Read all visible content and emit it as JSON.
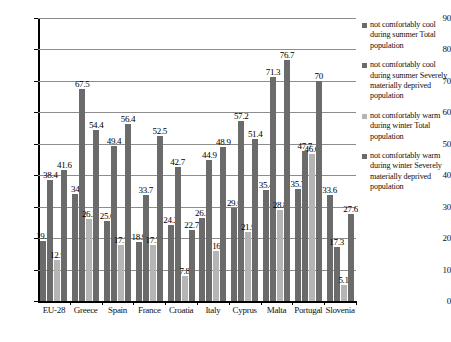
{
  "chart_data": {
    "type": "bar",
    "title": "",
    "subtitle": "",
    "xlabel": "",
    "ylabel": "",
    "ylim": [
      0,
      90
    ],
    "ytick_step": 10,
    "yticks": [
      0,
      10,
      20,
      30,
      40,
      50,
      60,
      70,
      80,
      90
    ],
    "grid": true,
    "grid_axis": "y",
    "legend_position": "right",
    "categories": [
      "EU-28",
      "Greece",
      "Spain",
      "France",
      "Croatia",
      "Italy",
      "Cyprus",
      "Malta",
      "Portugal",
      "Slovenia"
    ],
    "series": [
      {
        "name": "not comfortably cool during summer  Total population",
        "color": "#6b6b6b",
        "values": [
          19.2,
          34,
          25.6,
          18.9,
          24.2,
          26.3,
          29.6,
          35.4,
          35.7,
          33.6
        ]
      },
      {
        "name": "not comfortably cool during summer Severely materially deprived population",
        "color": "#6b6b6b",
        "values": [
          38.4,
          67.5,
          49.4,
          33.7,
          42.7,
          44.9,
          57.2,
          71.3,
          47.7,
          17.3
        ]
      },
      {
        "name": "not comfortably warm during winter Total population",
        "color": "#b5b5b5",
        "values": [
          12.9,
          26.2,
          17.7,
          17.7,
          7.8,
          16,
          21.9,
          28.8,
          46.6,
          5.1
        ]
      },
      {
        "name": "not comfortably warm during winter Severely materially deprived population",
        "color": "#6b6b6b",
        "values": [
          41.6,
          54.4,
          56.4,
          52.5,
          22.7,
          48.9,
          51.4,
          76.7,
          70,
          27.6
        ]
      }
    ]
  },
  "legend": {
    "items": [
      {
        "label": "not comfortably cool during summer  Total population",
        "swatch": "sw1"
      },
      {
        "label": "not comfortably cool during summer Severely materially deprived population",
        "swatch": "sw2"
      },
      {
        "label": "not comfortably warm during winter Total population",
        "swatch": "sw3"
      },
      {
        "label": "not comfortably warm during winter Severely materially deprived population",
        "swatch": "sw4"
      }
    ]
  }
}
